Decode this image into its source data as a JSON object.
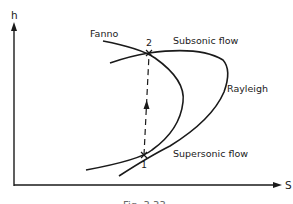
{
  "diagram": {
    "axes": {
      "y_label": "h",
      "x_label": "S"
    },
    "curves": {
      "fanno": "Fanno",
      "rayleigh": "Rayleigh"
    },
    "regions": {
      "subsonic": "Subsonic flow",
      "supersonic": "Supersonic flow"
    },
    "points": {
      "p1": "1",
      "p2": "2"
    },
    "caption": "Fig. 3.33",
    "colors": {
      "ink": "#1a1a1a",
      "background": "#ffffff"
    }
  }
}
